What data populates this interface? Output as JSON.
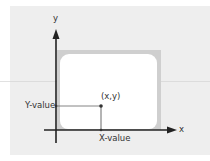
{
  "diagram": {
    "title": "",
    "axes": {
      "x_label": "x",
      "y_label": "y"
    },
    "point": {
      "label": "(x,y)",
      "x_value_label": "X-value",
      "y_value_label": "Y-value"
    },
    "shapes": {
      "screen_frame": "rounded rectangle representing a screen inside the coordinate plane"
    },
    "colors": {
      "background": "#eeeeee",
      "frame": "#cfcfcf",
      "screen": "#ffffff",
      "axis": "#222222",
      "guide_line": "#555555"
    }
  }
}
